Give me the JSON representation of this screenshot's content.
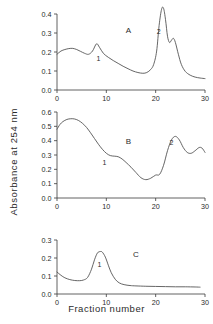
{
  "figure": {
    "ylabel": "Absorbance at 254 nm",
    "xlabel": "Fraction number",
    "line_color": "#555555",
    "axis_color": "#3a3a3a",
    "background": "#ffffff"
  },
  "chart_data": [
    {
      "type": "line",
      "title": "A",
      "panel": "A",
      "xlabel": "",
      "ylabel": "Absorbance at 254 nm",
      "xlim": [
        0,
        30
      ],
      "ylim": [
        0.0,
        0.4
      ],
      "xticks": [
        0,
        10,
        20,
        30
      ],
      "xticklabels": [
        "0",
        "10",
        "20",
        "30"
      ],
      "yticks": [
        0.0,
        0.1,
        0.2,
        0.3,
        0.4
      ],
      "yticklabels": [
        "0.0",
        "0.1",
        "0.2",
        "0.3",
        "0.4"
      ],
      "grid": false,
      "legend": "none",
      "annotations": [
        {
          "text": "A",
          "x": 14.5,
          "y": 0.3
        },
        {
          "text": "1",
          "x": 8.4,
          "y": 0.155
        },
        {
          "text": "2",
          "x": 20.6,
          "y": 0.295
        }
      ],
      "x": [
        0,
        0.8,
        1.6,
        2.4,
        3.2,
        4.0,
        4.8,
        5.6,
        6.4,
        7.2,
        8.0,
        8.6,
        9.4,
        10.4,
        11.4,
        12.4,
        13.4,
        14.4,
        15.4,
        16.4,
        17.4,
        18.2,
        19.0,
        19.6,
        20.2,
        20.7,
        21.2,
        21.6,
        22.0,
        22.4,
        22.8,
        23.2,
        23.6,
        24.0,
        24.6,
        25.2,
        26.0,
        27.0,
        28.0,
        29.0,
        30.0
      ],
      "y": [
        0.188,
        0.205,
        0.213,
        0.218,
        0.219,
        0.213,
        0.203,
        0.193,
        0.188,
        0.205,
        0.243,
        0.225,
        0.193,
        0.172,
        0.155,
        0.14,
        0.125,
        0.112,
        0.1,
        0.092,
        0.088,
        0.092,
        0.108,
        0.135,
        0.205,
        0.34,
        0.425,
        0.43,
        0.37,
        0.283,
        0.25,
        0.262,
        0.272,
        0.25,
        0.188,
        0.135,
        0.098,
        0.078,
        0.068,
        0.063,
        0.06
      ],
      "series": [
        {
          "name": "Panel A elution profile",
          "peaks": [
            {
              "label": "1",
              "x": 8.0,
              "y": 0.243
            },
            {
              "label": "2",
              "x": 21.4,
              "y": 0.43
            },
            {
              "label": "",
              "x": 23.6,
              "y": 0.272
            }
          ]
        }
      ]
    },
    {
      "type": "line",
      "title": "B",
      "panel": "B",
      "xlabel": "",
      "ylabel": "Absorbance at 254 nm",
      "xlim": [
        0,
        30
      ],
      "ylim": [
        0.0,
        0.6
      ],
      "xticks": [
        0,
        10,
        20,
        30
      ],
      "xticklabels": [
        "0",
        "10",
        "20",
        "30"
      ],
      "yticks": [
        0.0,
        0.1,
        0.2,
        0.3,
        0.4,
        0.5,
        0.6
      ],
      "yticklabels": [
        "0.0",
        "0.1",
        "0.2",
        "0.3",
        "0.4",
        "0.5",
        "0.6"
      ],
      "grid": false,
      "legend": "none",
      "annotations": [
        {
          "text": "B",
          "x": 14.5,
          "y": 0.375
        },
        {
          "text": "1",
          "x": 9.6,
          "y": 0.228
        },
        {
          "text": "2",
          "x": 23.2,
          "y": 0.368
        }
      ],
      "x": [
        0,
        0.6,
        1.2,
        2.0,
        2.8,
        3.6,
        4.4,
        5.2,
        6.0,
        6.8,
        7.6,
        8.4,
        9.2,
        10.0,
        10.8,
        11.6,
        12.4,
        13.2,
        14.0,
        15.0,
        16.0,
        17.0,
        18.0,
        19.0,
        20.0,
        20.8,
        21.6,
        22.4,
        23.2,
        24.0,
        24.8,
        25.6,
        26.4,
        27.2,
        28.0,
        28.8,
        29.4,
        30.0
      ],
      "y": [
        0.48,
        0.513,
        0.533,
        0.548,
        0.553,
        0.551,
        0.54,
        0.52,
        0.492,
        0.455,
        0.415,
        0.375,
        0.34,
        0.312,
        0.296,
        0.292,
        0.288,
        0.272,
        0.248,
        0.215,
        0.178,
        0.142,
        0.128,
        0.138,
        0.16,
        0.165,
        0.228,
        0.33,
        0.405,
        0.43,
        0.405,
        0.352,
        0.318,
        0.312,
        0.33,
        0.352,
        0.348,
        0.318
      ],
      "series": [
        {
          "name": "Panel B elution profile",
          "peaks": [
            {
              "label": "",
              "x": 3.0,
              "y": 0.553
            },
            {
              "label": "1",
              "x": 11.2,
              "y": 0.293
            },
            {
              "label": "2",
              "x": 24.0,
              "y": 0.43
            },
            {
              "label": "",
              "x": 28.9,
              "y": 0.352
            }
          ]
        }
      ]
    },
    {
      "type": "line",
      "title": "C",
      "panel": "C",
      "xlabel": "Fraction number",
      "ylabel": "Absorbance at 254 nm",
      "xlim": [
        0,
        30
      ],
      "ylim": [
        0.0,
        0.3
      ],
      "xticks": [
        0,
        10,
        20,
        30
      ],
      "xticklabels": [
        "0",
        "10",
        "20",
        "30"
      ],
      "yticks": [
        0.0,
        0.1,
        0.2,
        0.3
      ],
      "yticklabels": [
        "0.0",
        "0.1",
        "0.2",
        "0.3"
      ],
      "grid": false,
      "legend": "none",
      "annotations": [
        {
          "text": "C",
          "x": 16.0,
          "y": 0.205
        },
        {
          "text": "1",
          "x": 8.6,
          "y": 0.148
        }
      ],
      "x": [
        0,
        0.8,
        1.6,
        2.6,
        3.6,
        4.6,
        5.4,
        6.2,
        7.0,
        7.6,
        8.2,
        8.8,
        9.2,
        9.8,
        10.4,
        11.0,
        11.8,
        12.6,
        13.6,
        14.8,
        16.0,
        18.0,
        20.0,
        22.0,
        24.0,
        26.0,
        28.0,
        29.0
      ],
      "y": [
        0.122,
        0.104,
        0.09,
        0.08,
        0.075,
        0.074,
        0.078,
        0.092,
        0.138,
        0.19,
        0.228,
        0.236,
        0.232,
        0.205,
        0.16,
        0.118,
        0.082,
        0.062,
        0.052,
        0.047,
        0.045,
        0.043,
        0.042,
        0.041,
        0.04,
        0.04,
        0.039,
        0.038
      ],
      "series": [
        {
          "name": "Panel C elution profile",
          "peaks": [
            {
              "label": "1",
              "x": 8.9,
              "y": 0.236
            }
          ]
        }
      ]
    }
  ]
}
